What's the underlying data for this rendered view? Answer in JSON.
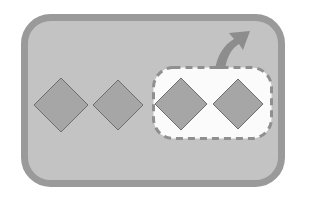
{
  "canvas": {
    "width": 313,
    "height": 207,
    "background_color": "#ffffff",
    "description": "Diagram of a row of four diamond shapes inside a rounded rectangle frame; the two right-hand diamonds are enclosed by a dashed selection boundary with a curved arrow pointing up and to the right out of it."
  },
  "container": {
    "name": "rounded-rectangle-frame",
    "x": 21,
    "y": 14,
    "width": 264,
    "height": 173,
    "corner_radius": 26,
    "fill_color": "#c3c3c3",
    "stroke_color": "#9a9a9a",
    "stroke_width": 7
  },
  "selection": {
    "name": "dashed-selection-region",
    "x": 152,
    "y": 66,
    "width": 121,
    "height": 74,
    "corner_radius": 20,
    "fill_color": "#fbfbfb",
    "stroke_color": "#8f8f8f",
    "stroke_width": 3,
    "dash_pattern": "7 5"
  },
  "diamonds": [
    {
      "label": "diamond-1",
      "cx": 61,
      "cy": 105,
      "rx": 27,
      "ry": 27,
      "selected": false
    },
    {
      "label": "diamond-2",
      "cx": 118,
      "cy": 105,
      "rx": 25,
      "ry": 25,
      "selected": false
    },
    {
      "label": "diamond-3",
      "cx": 181,
      "cy": 104,
      "rx": 26,
      "ry": 26,
      "selected": true
    },
    {
      "label": "diamond-4",
      "cx": 238,
      "cy": 104,
      "rx": 25,
      "ry": 25,
      "selected": true
    }
  ],
  "diamond_style": {
    "fill_color": "#a6a6a6",
    "stroke_color": "#6e6e6e",
    "stroke_width": 1
  },
  "arrow": {
    "name": "curved-up-right-arrow",
    "fill_color": "#8d8d8d",
    "tail_x": 219,
    "tail_y": 69,
    "tip_x": 249,
    "tip_y": 32,
    "path": "M 215 69 C 218 54 224 45 234 39 L 229 33 L 250 31 L 243 50 L 239 44 C 231 49 227 57 225 69 Z"
  }
}
